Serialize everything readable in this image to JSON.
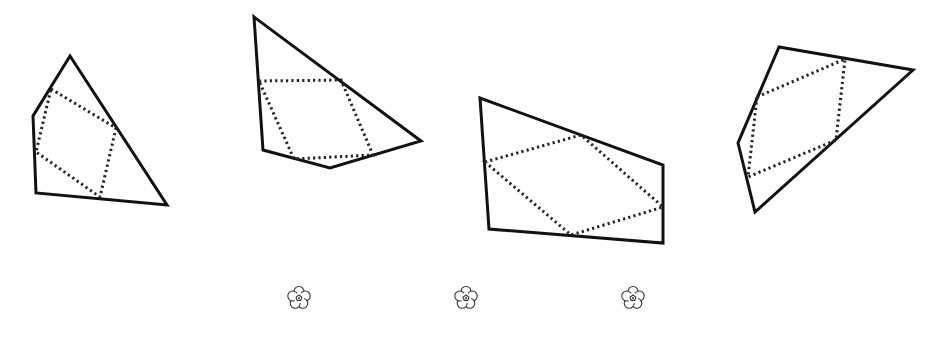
{
  "diagram": {
    "title": "",
    "background": "#ffffff",
    "stroke_color": "#111111",
    "quadrilaterals": [
      {
        "id": "shape-1",
        "outer": [
          [
            70,
            56
          ],
          [
            33,
            116
          ],
          [
            36,
            193
          ],
          [
            167,
            205
          ]
        ],
        "inscribed_dotted": [
          [
            51,
            89
          ],
          [
            116,
            128
          ],
          [
            100,
            197
          ],
          [
            36,
            152
          ]
        ]
      },
      {
        "id": "shape-2",
        "outer": [
          [
            254,
            17
          ],
          [
            263,
            150
          ],
          [
            330,
            168
          ],
          [
            421,
            141
          ]
        ],
        "inscribed_dotted": [
          [
            259,
            81
          ],
          [
            341,
            80
          ],
          [
            373,
            155
          ],
          [
            294,
            159
          ]
        ]
      },
      {
        "id": "shape-3",
        "outer": [
          [
            480,
            98
          ],
          [
            489,
            229
          ],
          [
            663,
            243
          ],
          [
            663,
            165
          ]
        ],
        "inscribed_dotted": [
          [
            485,
            162
          ],
          [
            581,
            135
          ],
          [
            663,
            207
          ],
          [
            571,
            235
          ]
        ]
      },
      {
        "id": "shape-4",
        "outer": [
          [
            779,
            47
          ],
          [
            738,
            143
          ],
          [
            755,
            212
          ],
          [
            913,
            70
          ]
        ],
        "inscribed_dotted": [
          [
            757,
            97
          ],
          [
            845,
            59
          ],
          [
            836,
            140
          ],
          [
            748,
            177
          ]
        ]
      }
    ],
    "decorations": [
      {
        "icon": "flower-icon",
        "center": [
          299,
          298
        ]
      },
      {
        "icon": "flower-icon",
        "center": [
          466,
          298
        ]
      },
      {
        "icon": "flower-icon",
        "center": [
          633,
          298
        ]
      }
    ]
  }
}
